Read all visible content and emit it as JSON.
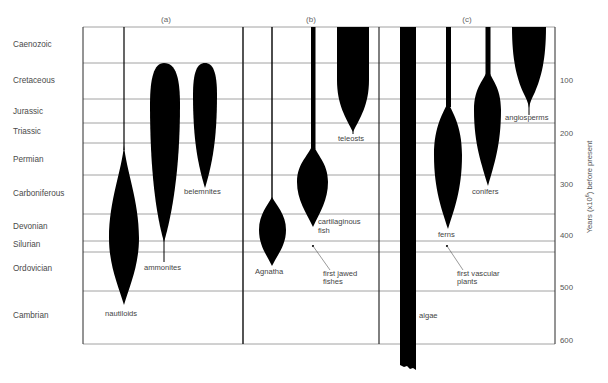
{
  "chart_data": {
    "type": "diagram-spindle",
    "title": "",
    "panels": [
      {
        "id": "a",
        "label": "(a)"
      },
      {
        "id": "b",
        "label": "(b)"
      },
      {
        "id": "c",
        "label": "(c)"
      }
    ],
    "periods": [
      {
        "name": "Caenozoic",
        "top": 0,
        "bottom": 65
      },
      {
        "name": "Cretaceous",
        "top": 65,
        "bottom": 135
      },
      {
        "name": "Jurassic",
        "top": 135,
        "bottom": 180
      },
      {
        "name": "Triassic",
        "top": 180,
        "bottom": 225
      },
      {
        "name": "Permian",
        "top": 225,
        "bottom": 280
      },
      {
        "name": "Carboniferous",
        "top": 280,
        "bottom": 345
      },
      {
        "name": "Devonian",
        "top": 345,
        "bottom": 395
      },
      {
        "name": "Silurian",
        "top": 395,
        "bottom": 430
      },
      {
        "name": "Ordovician",
        "top": 430,
        "bottom": 500
      },
      {
        "name": "Cambrian",
        "top": 500,
        "bottom": 600
      }
    ],
    "ylabel": "Years (x10⁶) before present",
    "yticks": [
      "100",
      "200",
      "300",
      "400",
      "500",
      "600"
    ],
    "ylim": [
      0,
      600
    ],
    "groups": [
      {
        "panel": "a",
        "name": "nautiloids",
        "origin_myr": 510,
        "max_diversity_myr": 390,
        "extends_to_present": true
      },
      {
        "panel": "a",
        "name": "ammonites",
        "origin_myr": 420,
        "extinct_myr": 65,
        "max_diversity_myr": 200
      },
      {
        "panel": "a",
        "name": "belemnites",
        "origin_myr": 310,
        "extinct_myr": 65,
        "max_diversity_myr": 170
      },
      {
        "panel": "b",
        "name": "Agnatha",
        "origin_myr": 440,
        "max_diversity_myr": 395,
        "extends_to_present": true
      },
      {
        "panel": "b",
        "name": "cartilaginous fish",
        "origin_myr": 370,
        "max_diversity_myr": 300,
        "extends_to_present": true
      },
      {
        "panel": "b",
        "name": "teleosts",
        "origin_myr": 200,
        "max_diversity_myr": 0,
        "extends_to_present": true
      },
      {
        "panel": "c",
        "name": "algae",
        "origin_myr": 650,
        "extends_to_present": true
      },
      {
        "panel": "c",
        "name": "ferns",
        "origin_myr": 380,
        "max_diversity_myr": 240,
        "extends_to_present": true
      },
      {
        "panel": "c",
        "name": "conifers",
        "origin_myr": 300,
        "max_diversity_myr": 150,
        "extends_to_present": true
      },
      {
        "panel": "c",
        "name": "angiosperms",
        "origin_myr": 150,
        "max_diversity_myr": 20,
        "extends_to_present": true
      }
    ],
    "annotations": [
      {
        "panel": "b",
        "text": "first jawed fishes",
        "myr": 400
      },
      {
        "panel": "c",
        "text": "first vascular plants",
        "myr": 400
      }
    ]
  },
  "labels": {
    "panel_a": "(a)",
    "panel_b": "(b)",
    "panel_c": "(c)",
    "nautiloids": "nautiloids",
    "ammonites": "ammonites",
    "belemnites": "belemnites",
    "agnatha": "Agnatha",
    "cart_1": "cartilaginous",
    "cart_2": "fish",
    "teleosts": "teleosts",
    "jawed_1": "first jawed",
    "jawed_2": "fishes",
    "algae": "algae",
    "ferns": "ferns",
    "vasc_1": "first vascular",
    "vasc_2": "plants",
    "conifers": "conifers",
    "angiosperms": "angiosperms",
    "ylabel": "Years (x10⁶) before present",
    "ylabel_main": "Years (x10",
    "ylabel_sup": "6",
    "ylabel_tail": ") before present"
  },
  "periods_display": [
    {
      "name": "Caenozoic",
      "y": 47
    },
    {
      "name": "Cretaceous",
      "y": 83
    },
    {
      "name": "Jurassic",
      "y": 114
    },
    {
      "name": "Triassic",
      "y": 134
    },
    {
      "name": "Permian",
      "y": 162
    },
    {
      "name": "Carboniferous",
      "y": 196
    },
    {
      "name": "Devonian",
      "y": 229
    },
    {
      "name": "Silurian",
      "y": 247
    },
    {
      "name": "Ordovician",
      "y": 271
    },
    {
      "name": "Cambrian",
      "y": 318
    }
  ],
  "ticks_display": [
    {
      "label": "100",
      "y": 83
    },
    {
      "label": "200",
      "y": 136
    },
    {
      "label": "300",
      "y": 187
    },
    {
      "label": "400",
      "y": 238
    },
    {
      "label": "500",
      "y": 290
    },
    {
      "label": "600",
      "y": 343
    }
  ],
  "colors": {
    "ink": "#000000",
    "frame": "#2a2a2a",
    "grid": "#8c8c8c",
    "text": "#4a4a4a"
  }
}
